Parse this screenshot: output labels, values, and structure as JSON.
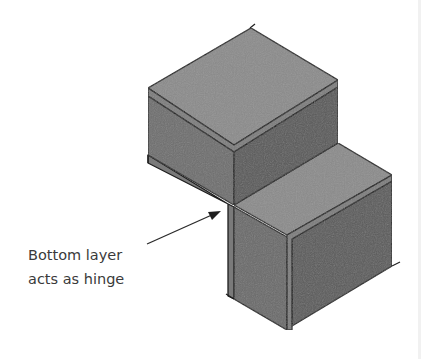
{
  "diagram": {
    "annotation": {
      "line1": "Bottom layer",
      "line2": "acts as hinge"
    },
    "colors": {
      "top_face": "#8b8b8b",
      "left_face": "#6e6e6e",
      "right_face": "#5a5a5a",
      "layer_band": "#7a7a7a",
      "edge": "#1e1e1e",
      "text": "#3a3a3a"
    },
    "elements": [
      "upper-block",
      "lower-block",
      "bottom-layer-hinge",
      "annotation-arrow"
    ]
  }
}
